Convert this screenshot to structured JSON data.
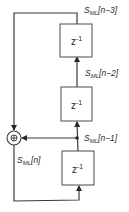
{
  "diagram": {
    "type": "block-diagram",
    "colors": {
      "line": "#3a3a3a",
      "box_stroke": "#4a4a4a",
      "background": "#ffffff",
      "text": "#2a2a2a"
    },
    "adder": {
      "symbol": "⊕"
    },
    "blocks": [
      {
        "id": "delay-top",
        "label_base": "z",
        "label_exp": "-1"
      },
      {
        "id": "delay-middle",
        "label_base": "z",
        "label_exp": "-1"
      },
      {
        "id": "delay-bottom",
        "label_base": "z",
        "label_exp": "-1"
      }
    ],
    "signals": [
      {
        "id": "n3",
        "base": "S",
        "sub": "ML",
        "index": "[n−3]"
      },
      {
        "id": "n2",
        "base": "S",
        "sub": "ML",
        "index": "[n−2]"
      },
      {
        "id": "n1",
        "base": "S",
        "sub": "ML",
        "index": "[n−1]"
      },
      {
        "id": "n0",
        "base": "S",
        "sub": "ML",
        "index": "[n]"
      }
    ]
  }
}
